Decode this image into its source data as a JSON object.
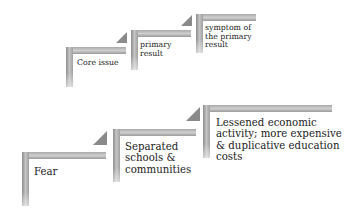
{
  "diagram": {
    "type": "staircase-process",
    "legend_row": {
      "steps": [
        {
          "label": "Core issue"
        },
        {
          "label": "primary result",
          "lines": [
            "primary",
            "result"
          ]
        },
        {
          "label": "symptom of the primary result",
          "lines": [
            "symptom of",
            "the primary",
            "result"
          ]
        }
      ]
    },
    "example_row": {
      "steps": [
        {
          "label": "Fear"
        },
        {
          "label": "Separated schools & communities",
          "lines": [
            "Separated",
            "schools &",
            "communities"
          ]
        },
        {
          "label": "Lessened economic activity; more expensive & duplicative education costs",
          "lines": [
            "Lessened economic",
            "activity; more expensive",
            "& duplicative education",
            "costs"
          ]
        }
      ]
    },
    "colors": {
      "bar": "#b0b0b0",
      "arrow": "#8a8a8a",
      "text": "#222222"
    }
  }
}
